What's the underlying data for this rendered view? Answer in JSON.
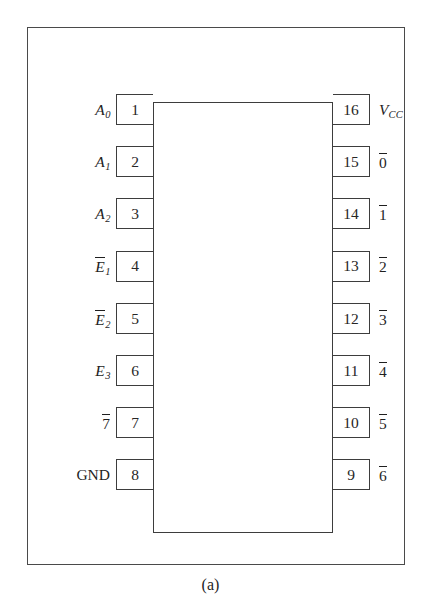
{
  "figure": {
    "caption": "(a)",
    "package": "16-pin DIP",
    "colors": {
      "background": "#ffffff",
      "frame_line": "#4a4a4a",
      "body_line": "#3d3d3d",
      "text": "#1f1f1f"
    }
  },
  "pins": {
    "left": [
      {
        "number": "1",
        "label": "A",
        "sub": "0",
        "overbar": false,
        "italic": true,
        "plain_label": "A0"
      },
      {
        "number": "2",
        "label": "A",
        "sub": "1",
        "overbar": false,
        "italic": true,
        "plain_label": "A1"
      },
      {
        "number": "3",
        "label": "A",
        "sub": "2",
        "overbar": false,
        "italic": true,
        "plain_label": "A2"
      },
      {
        "number": "4",
        "label": "E",
        "sub": "1",
        "overbar": true,
        "italic": true,
        "plain_label": "E1-bar"
      },
      {
        "number": "5",
        "label": "E",
        "sub": "2",
        "overbar": true,
        "italic": true,
        "plain_label": "E2-bar"
      },
      {
        "number": "6",
        "label": "E",
        "sub": "3",
        "overbar": false,
        "italic": true,
        "plain_label": "E3"
      },
      {
        "number": "7",
        "label": "7",
        "sub": "",
        "overbar": true,
        "italic": false,
        "plain_label": "7-bar"
      },
      {
        "number": "8",
        "label": "GND",
        "sub": "",
        "overbar": false,
        "italic": false,
        "plain_label": "GND"
      }
    ],
    "right": [
      {
        "number": "16",
        "label": "V",
        "sub": "CC",
        "overbar": false,
        "italic": true,
        "plain_label": "VCC"
      },
      {
        "number": "15",
        "label": "0",
        "sub": "",
        "overbar": true,
        "italic": false,
        "plain_label": "0-bar"
      },
      {
        "number": "14",
        "label": "1",
        "sub": "",
        "overbar": true,
        "italic": false,
        "plain_label": "1-bar"
      },
      {
        "number": "13",
        "label": "2",
        "sub": "",
        "overbar": true,
        "italic": false,
        "plain_label": "2-bar"
      },
      {
        "number": "12",
        "label": "3",
        "sub": "",
        "overbar": true,
        "italic": false,
        "plain_label": "3-bar"
      },
      {
        "number": "11",
        "label": "4",
        "sub": "",
        "overbar": true,
        "italic": false,
        "plain_label": "4-bar"
      },
      {
        "number": "10",
        "label": "5",
        "sub": "",
        "overbar": true,
        "italic": false,
        "plain_label": "5-bar"
      },
      {
        "number": "9",
        "label": "6",
        "sub": "",
        "overbar": true,
        "italic": false,
        "plain_label": "6-bar"
      }
    ]
  },
  "layout": {
    "pin_top_start": 93,
    "pin_spacing": 52.2
  }
}
